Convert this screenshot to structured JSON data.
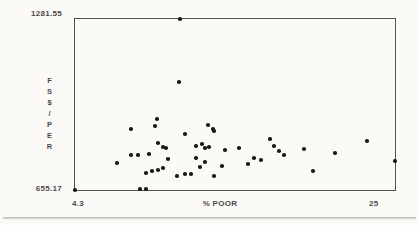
{
  "figure": {
    "background_color": "#fbfaf7",
    "frame_color": "#525252",
    "text_color": "#4a4a4a"
  },
  "chart_data": {
    "type": "scatter",
    "title": "",
    "xlabel": "% POOR",
    "ylabel": "FS$/PER",
    "xlim": [
      4.3,
      25
    ],
    "ylim": [
      655.17,
      1281.55
    ],
    "x_tick_labels": [
      "4.3",
      "25"
    ],
    "y_tick_labels": [
      "655.17",
      "1281.55"
    ],
    "grid": false,
    "legend": null,
    "marker": {
      "shape": "dot",
      "size_px": 4,
      "color": "#1a1a1a"
    },
    "points": [
      [
        11.1,
        1281.55
      ],
      [
        11.0,
        1050
      ],
      [
        9.6,
        915
      ],
      [
        9.5,
        888
      ],
      [
        7.9,
        880
      ],
      [
        9.7,
        828
      ],
      [
        10.0,
        813
      ],
      [
        10.2,
        810
      ],
      [
        7.9,
        783
      ],
      [
        8.4,
        783
      ],
      [
        9.1,
        786
      ],
      [
        7.0,
        753
      ],
      [
        8.9,
        717
      ],
      [
        9.3,
        723
      ],
      [
        9.7,
        730
      ],
      [
        10.0,
        737
      ],
      [
        10.3,
        767
      ],
      [
        10.9,
        708
      ],
      [
        11.4,
        714
      ],
      [
        4.3,
        655.17
      ],
      [
        8.5,
        658
      ],
      [
        8.9,
        658
      ],
      [
        12.9,
        894
      ],
      [
        13.2,
        879
      ],
      [
        13.3,
        871
      ],
      [
        11.4,
        860
      ],
      [
        16.9,
        842
      ],
      [
        12.1,
        816
      ],
      [
        12.5,
        824
      ],
      [
        12.7,
        810
      ],
      [
        13.0,
        812
      ],
      [
        14.0,
        800
      ],
      [
        14.9,
        808
      ],
      [
        17.2,
        816
      ],
      [
        17.5,
        798
      ],
      [
        17.8,
        783
      ],
      [
        15.9,
        774
      ],
      [
        16.3,
        764
      ],
      [
        15.5,
        752
      ],
      [
        12.1,
        771
      ],
      [
        12.4,
        738
      ],
      [
        12.7,
        757
      ],
      [
        13.8,
        742
      ],
      [
        11.8,
        713
      ],
      [
        13.3,
        708
      ],
      [
        19.1,
        806
      ],
      [
        21.1,
        789
      ],
      [
        23.2,
        834
      ],
      [
        19.7,
        725
      ],
      [
        25.0,
        762
      ]
    ]
  }
}
